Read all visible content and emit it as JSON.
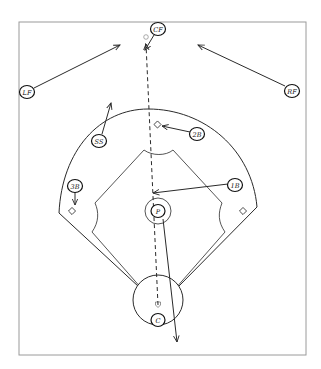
{
  "diagram": {
    "type": "baseball-field-play",
    "colors": {
      "line": "#2a2a2a",
      "frame": "#9a9a9a",
      "ball": "#888888",
      "background": "#ffffff"
    },
    "positions": [
      {
        "id": "cf",
        "label": "CF",
        "x": 158,
        "y": 29
      },
      {
        "id": "lf",
        "label": "LF",
        "x": 27,
        "y": 92
      },
      {
        "id": "rf",
        "label": "RF",
        "x": 292,
        "y": 91
      },
      {
        "id": "ss",
        "label": "SS",
        "x": 99,
        "y": 141
      },
      {
        "id": "2b",
        "label": "2B",
        "x": 197,
        "y": 134
      },
      {
        "id": "3b",
        "label": "3B",
        "x": 75,
        "y": 186
      },
      {
        "id": "1b",
        "label": "1B",
        "x": 235,
        "y": 185
      },
      {
        "id": "p",
        "label": "P",
        "x": 158,
        "y": 211
      },
      {
        "id": "c",
        "label": "C",
        "x": 158,
        "y": 320
      }
    ],
    "movements": [
      {
        "from": "CF",
        "to": "fly-ball",
        "x1": 154,
        "y1": 35,
        "x2": 145,
        "y2": 50
      },
      {
        "from": "LF",
        "to": "backup",
        "x1": 34,
        "y1": 88,
        "x2": 120,
        "y2": 45
      },
      {
        "from": "RF",
        "to": "backup",
        "x1": 285,
        "y1": 86,
        "x2": 198,
        "y2": 45
      },
      {
        "from": "SS",
        "to": "outfield",
        "x1": 102,
        "y1": 134,
        "x2": 111,
        "y2": 103
      },
      {
        "from": "2B",
        "to": "2B-base",
        "x1": 190,
        "y1": 132,
        "x2": 162,
        "y2": 126
      },
      {
        "from": "3B",
        "to": "3B-base",
        "x1": 75,
        "y1": 192,
        "x2": 75,
        "y2": 205
      },
      {
        "from": "1B",
        "to": "cutoff",
        "x1": 228,
        "y1": 184,
        "x2": 153,
        "y2": 193
      },
      {
        "from": "P",
        "to": "backup-home",
        "x1": 163,
        "y1": 219,
        "x2": 177,
        "y2": 342
      }
    ],
    "ball_path": {
      "style": "dashed",
      "x1": 158,
      "y1": 305,
      "x2": 146,
      "y2": 42
    },
    "ball": {
      "x": 146,
      "y": 38
    }
  }
}
